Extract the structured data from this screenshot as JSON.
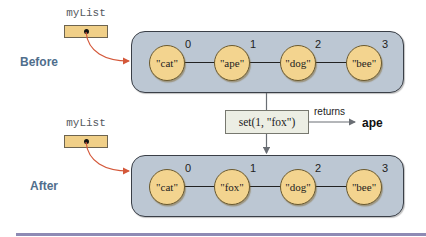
{
  "before": {
    "state_label": "Before",
    "variable_name": "myList",
    "elements": [
      {
        "index": "0",
        "value": "\"cat\""
      },
      {
        "index": "1",
        "value": "\"ape\""
      },
      {
        "index": "2",
        "value": "\"dog\""
      },
      {
        "index": "3",
        "value": "\"bee\""
      }
    ]
  },
  "operation": {
    "call": "set(1, \"fox\")",
    "returns_label": "returns",
    "return_value": "ape"
  },
  "after": {
    "state_label": "After",
    "variable_name": "myList",
    "elements": [
      {
        "index": "0",
        "value": "\"cat\""
      },
      {
        "index": "1",
        "value": "\"fox\""
      },
      {
        "index": "2",
        "value": "\"dog\""
      },
      {
        "index": "3",
        "value": "\"bee\""
      }
    ]
  },
  "colors": {
    "node_fill": "#f3d48f",
    "container_fill": "#bcc7d3",
    "pointer_arrow": "#d4583a",
    "state_label": "#4f6e8c",
    "bottom_rule": "#8e8ab4"
  }
}
